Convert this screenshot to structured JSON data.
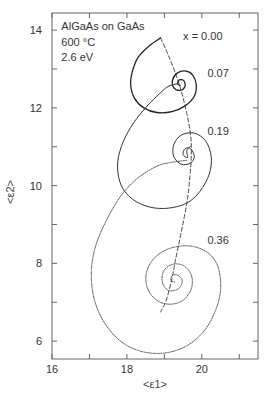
{
  "chart_data": {
    "type": "line",
    "title": "",
    "xlabel": "<ε1>",
    "ylabel": "<ε2>",
    "xlim": [
      16,
      21.5
    ],
    "ylim": [
      5.54,
      14.44
    ],
    "xticks": [
      16,
      18,
      20
    ],
    "xminor": [
      17,
      19,
      21
    ],
    "yticks": [
      6,
      8,
      10,
      12,
      14
    ],
    "yminor": [
      7,
      9,
      11,
      13
    ],
    "grid": false,
    "annotations": [
      {
        "text": "AlGaAs on GaAs",
        "x": 16.25,
        "y": 14.0
      },
      {
        "text": "600 °C",
        "x": 16.25,
        "y": 13.6
      },
      {
        "text": "2.6 eV",
        "x": 16.25,
        "y": 13.2
      },
      {
        "text": "x =  0.00",
        "x": 19.5,
        "y": 13.75
      },
      {
        "text": "0.07",
        "x": 20.15,
        "y": 12.8
      },
      {
        "text": "0.19",
        "x": 20.15,
        "y": 11.3
      },
      {
        "text": "0.36",
        "x": 20.15,
        "y": 8.5
      }
    ],
    "series": [
      {
        "name": "x = 0.00 → 0.07",
        "style": "solid",
        "points": [
          [
            18.9,
            13.8
          ],
          [
            18.6,
            13.6
          ],
          [
            18.3,
            13.3
          ],
          [
            18.15,
            12.95
          ],
          [
            18.1,
            12.6
          ],
          [
            18.2,
            12.25
          ],
          [
            18.45,
            12.0
          ],
          [
            18.8,
            11.88
          ],
          [
            19.2,
            11.9
          ],
          [
            19.55,
            12.05
          ],
          [
            19.8,
            12.3
          ],
          [
            19.85,
            12.6
          ],
          [
            19.75,
            12.85
          ],
          [
            19.55,
            12.95
          ],
          [
            19.35,
            12.9
          ],
          [
            19.22,
            12.72
          ],
          [
            19.25,
            12.52
          ],
          [
            19.42,
            12.45
          ],
          [
            19.55,
            12.55
          ],
          [
            19.52,
            12.7
          ],
          [
            19.4,
            12.72
          ],
          [
            19.35,
            12.62
          ],
          [
            19.42,
            12.58
          ]
        ]
      },
      {
        "name": "x = 0.07 → 0.19",
        "style": "solid-thin",
        "points": [
          [
            19.35,
            12.62
          ],
          [
            19.1,
            12.55
          ],
          [
            18.8,
            12.3
          ],
          [
            18.45,
            11.95
          ],
          [
            18.1,
            11.5
          ],
          [
            17.85,
            11.0
          ],
          [
            17.75,
            10.5
          ],
          [
            17.85,
            10.0
          ],
          [
            18.15,
            9.65
          ],
          [
            18.6,
            9.45
          ],
          [
            19.1,
            9.42
          ],
          [
            19.6,
            9.55
          ],
          [
            19.95,
            9.85
          ],
          [
            20.2,
            10.3
          ],
          [
            20.25,
            10.75
          ],
          [
            20.1,
            11.15
          ],
          [
            19.8,
            11.35
          ],
          [
            19.45,
            11.3
          ],
          [
            19.25,
            11.05
          ],
          [
            19.25,
            10.75
          ],
          [
            19.45,
            10.55
          ],
          [
            19.7,
            10.58
          ],
          [
            19.8,
            10.75
          ],
          [
            19.7,
            10.95
          ],
          [
            19.55,
            10.95
          ],
          [
            19.5,
            10.8
          ],
          [
            19.62,
            10.72
          ],
          [
            19.6,
            10.9
          ],
          [
            19.7,
            11.02
          ]
        ]
      },
      {
        "name": "x = 0.19 → 0.36",
        "style": "dotted",
        "points": [
          [
            19.6,
            10.65
          ],
          [
            19.2,
            10.6
          ],
          [
            18.8,
            10.5
          ],
          [
            18.3,
            10.2
          ],
          [
            17.85,
            9.75
          ],
          [
            17.45,
            9.1
          ],
          [
            17.15,
            8.4
          ],
          [
            17.05,
            7.7
          ],
          [
            17.15,
            7.0
          ],
          [
            17.45,
            6.4
          ],
          [
            17.9,
            5.95
          ],
          [
            18.45,
            5.72
          ],
          [
            19.05,
            5.7
          ],
          [
            19.6,
            5.88
          ],
          [
            20.05,
            6.25
          ],
          [
            20.35,
            6.75
          ],
          [
            20.5,
            7.3
          ],
          [
            20.45,
            7.85
          ],
          [
            20.25,
            8.2
          ],
          [
            19.9,
            8.4
          ],
          [
            19.5,
            8.45
          ],
          [
            19.05,
            8.35
          ],
          [
            18.7,
            8.1
          ],
          [
            18.52,
            7.75
          ],
          [
            18.55,
            7.35
          ],
          [
            18.8,
            7.05
          ],
          [
            19.15,
            6.95
          ],
          [
            19.5,
            7.05
          ],
          [
            19.72,
            7.35
          ],
          [
            19.72,
            7.7
          ],
          [
            19.5,
            7.95
          ],
          [
            19.2,
            7.97
          ],
          [
            18.98,
            7.8
          ],
          [
            18.95,
            7.5
          ],
          [
            19.12,
            7.3
          ],
          [
            19.38,
            7.35
          ],
          [
            19.48,
            7.55
          ],
          [
            19.35,
            7.7
          ],
          [
            19.2,
            7.68
          ],
          [
            19.18,
            7.55
          ],
          [
            19.28,
            7.52
          ]
        ]
      },
      {
        "name": "locus",
        "style": "dashed",
        "points": [
          [
            18.9,
            13.8
          ],
          [
            19.15,
            13.25
          ],
          [
            19.4,
            12.6
          ],
          [
            19.6,
            11.85
          ],
          [
            19.7,
            11.3
          ],
          [
            19.72,
            10.8
          ],
          [
            19.68,
            10.2
          ],
          [
            19.6,
            9.55
          ],
          [
            19.45,
            8.8
          ],
          [
            19.3,
            8.1
          ],
          [
            19.2,
            7.6
          ],
          [
            19.05,
            7.05
          ],
          [
            18.9,
            6.75
          ]
        ]
      }
    ]
  }
}
